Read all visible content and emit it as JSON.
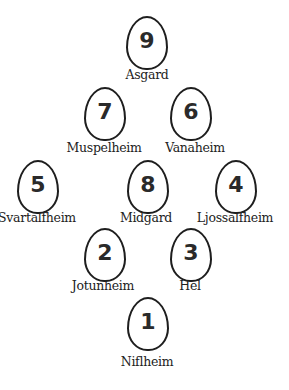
{
  "nodes": [
    {
      "number": "9",
      "name": "Asgard"
    },
    {
      "number": "7",
      "name": "Muspelheim"
    },
    {
      "number": "6",
      "name": "Vanaheim"
    },
    {
      "number": "5",
      "name": "Svartalfheim"
    },
    {
      "number": "8",
      "name": "Midgard"
    },
    {
      "number": "4",
      "name": "Ljossalfheim"
    },
    {
      "number": "2",
      "name": "Jotunheim"
    },
    {
      "number": "3",
      "name": "Hel"
    },
    {
      "number": "1",
      "name": "Niflheim"
    }
  ]
}
